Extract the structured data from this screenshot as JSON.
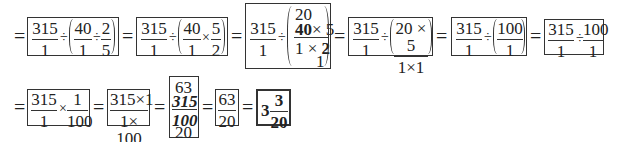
{
  "row1": {
    "eq": "=",
    "step1": {
      "a_num": "315",
      "a_den": "1",
      "op1": "÷",
      "b_num": "40",
      "b_den": "1",
      "op2": "÷",
      "c_num": "2",
      "c_den": "5"
    },
    "step2": {
      "a_num": "315",
      "a_den": "1",
      "op1": "÷",
      "b_num": "40",
      "b_den": "1",
      "op2": "×",
      "c_num": "5",
      "c_den": "2"
    },
    "step3": {
      "a_num": "315",
      "a_den": "1",
      "op1": "÷",
      "top_cancel": "20",
      "num": "40×5",
      "num_struck": "40",
      "num_rest": "× 5",
      "den_first": "1 × ",
      "den_struck": "2",
      "bottom_cancel": "1"
    },
    "step4": {
      "a_num": "315",
      "a_den": "1",
      "op1": "÷",
      "b_num": "20 × 5",
      "b_den": "1×1"
    },
    "step5": {
      "a_num": "315",
      "a_den": "1",
      "op1": "÷",
      "b_num": "100",
      "b_den": "1"
    },
    "step6": {
      "a_num": "315",
      "a_den": "1",
      "op1": "÷",
      "b_num": "100",
      "b_den": "1"
    }
  },
  "row2": {
    "eq": "=",
    "step7": {
      "a_num": "315",
      "a_den": "1",
      "op1": "×",
      "b_num": "1",
      "b_den": "100"
    },
    "step8": {
      "num": "315×1",
      "den": "1× 100"
    },
    "step9": {
      "top": "63",
      "num": "315",
      "den": "100",
      "bottom": "20"
    },
    "step10": {
      "num": "63",
      "den": "20"
    },
    "answer": {
      "whole": "3",
      "num": "3",
      "den": "20"
    }
  }
}
